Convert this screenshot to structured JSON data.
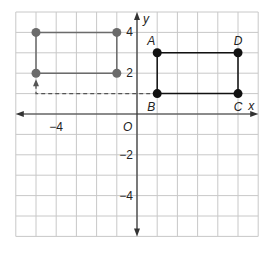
{
  "plane": {
    "x_min": -6,
    "x_max": 6,
    "y_min": -6,
    "y_max": 5,
    "origin_px": [
      137,
      114
    ],
    "unit_px_x": 20.2,
    "unit_px_y": 20.4,
    "grid_color": "#c8c8c8",
    "axis_color": "#333333"
  },
  "axes": {
    "x_label": "x",
    "y_label": "y",
    "origin_label": "O",
    "x_ticks": [
      {
        "value": -4,
        "label": "−4"
      }
    ],
    "y_ticks": [
      {
        "value": 4,
        "label": "4"
      },
      {
        "value": 2,
        "label": "2"
      },
      {
        "value": -2,
        "label": "−2"
      },
      {
        "value": -4,
        "label": "−4"
      }
    ]
  },
  "image_rectangle": {
    "color": "#6b6b6b",
    "points": [
      [
        -5,
        4
      ],
      [
        -1,
        4
      ],
      [
        -1,
        2
      ],
      [
        -5,
        2
      ]
    ]
  },
  "preimage_rectangle": {
    "color": "#111111",
    "points": [
      {
        "label": "A",
        "x": 1,
        "y": 3
      },
      {
        "label": "D",
        "x": 5,
        "y": 3
      },
      {
        "label": "C",
        "x": 5,
        "y": 1
      },
      {
        "label": "B",
        "x": 1,
        "y": 1
      }
    ]
  },
  "translation_path": {
    "from": [
      1,
      1
    ],
    "corner": [
      -5,
      1
    ],
    "to": [
      -5,
      2
    ],
    "color": "#555555"
  }
}
